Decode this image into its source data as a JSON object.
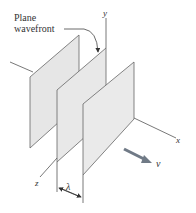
{
  "diagram": {
    "label_plane": "Plane",
    "label_wavefront": "wavefront",
    "axis_x": "x",
    "axis_y": "y",
    "axis_z": "z",
    "wavelength": "λ",
    "velocity": "v",
    "colors": {
      "plane_fill": "#e6e6e6",
      "plane_stroke": "#666666",
      "axis": "#555555",
      "arrow": "#707a86"
    }
  }
}
